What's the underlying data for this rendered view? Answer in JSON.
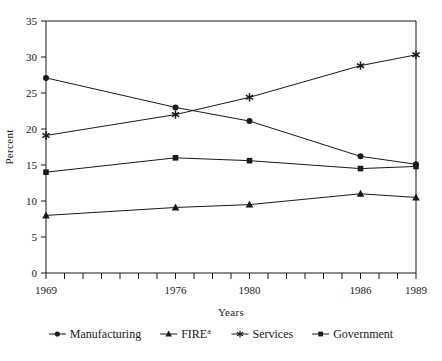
{
  "chart_data": {
    "type": "line",
    "title": "",
    "xlabel": "Years",
    "ylabel": "Percent",
    "x": [
      1969,
      1976,
      1980,
      1986,
      1989
    ],
    "xtick_labels": [
      "1969",
      "1976",
      "1980",
      "1986",
      "1989"
    ],
    "xlim": [
      1969,
      1989
    ],
    "ylim": [
      0,
      35
    ],
    "ytick_labels": [
      "0",
      "5",
      "10",
      "15",
      "20",
      "25",
      "30",
      "35"
    ],
    "ytick_values": [
      0,
      5,
      10,
      15,
      20,
      25,
      30,
      35
    ],
    "grid": false,
    "legend_position": "bottom",
    "minor_xticks_every": 1,
    "series": [
      {
        "name": "Manufacturing",
        "marker": "circle",
        "color": "#1a1a1a",
        "values": [
          27.1,
          23.0,
          21.1,
          16.2,
          15.1
        ]
      },
      {
        "name": "FIRE",
        "name_superscript": "a",
        "marker": "triangle",
        "color": "#1a1a1a",
        "values": [
          8.0,
          9.1,
          9.5,
          11.0,
          10.5
        ]
      },
      {
        "name": "Services",
        "marker": "star",
        "color": "#1a1a1a",
        "values": [
          19.1,
          22.0,
          24.4,
          28.8,
          30.3
        ]
      },
      {
        "name": "Government",
        "marker": "square",
        "color": "#1a1a1a",
        "values": [
          14.0,
          16.0,
          15.6,
          14.5,
          14.8
        ]
      }
    ]
  },
  "axis": {
    "x_label": "Years",
    "y_label": "Percent"
  },
  "legend": {
    "items": [
      {
        "label": "Manufacturing",
        "superscript": "",
        "marker": "circle"
      },
      {
        "label": "FIRE",
        "superscript": "a",
        "marker": "triangle"
      },
      {
        "label": "Services",
        "superscript": "",
        "marker": "star"
      },
      {
        "label": "Government",
        "superscript": "",
        "marker": "square"
      }
    ]
  },
  "colors": {
    "line": "#1a1a1a",
    "axis": "#1a1a1a",
    "background": "#ffffff"
  }
}
